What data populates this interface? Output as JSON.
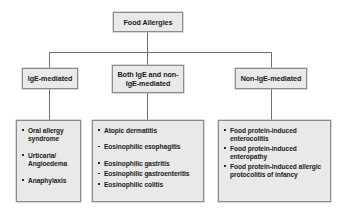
{
  "diagram": {
    "root": {
      "label": "Food Allergies"
    },
    "branches": [
      {
        "label": "IgE-mediated"
      },
      {
        "label": "Both IgE and non-IgE-mediated"
      },
      {
        "label": "Non-IgE-mediated"
      }
    ],
    "lists": [
      {
        "items": [
          "Oral allergy syndrome",
          "Urticaria/ Angioedema",
          "Anaphylaxis"
        ]
      },
      {
        "items": [
          "Atopic dermatitis",
          "Eosinophilic esophagitis",
          "Eosinophilic gastritis",
          "Eosinophilic gastroenteritis",
          "Eosinophilic colitis"
        ]
      },
      {
        "items": [
          "Food protein-induced enterocolitis",
          "Food protein-induced enteropathy",
          "Food protein-induced allergic protocolitis of infancy"
        ]
      }
    ],
    "colors": {
      "box_fill": "#e9e9e9",
      "box_border": "#8c8c8c",
      "connector": "#707070",
      "text": "#1a1a1a",
      "background": "#ffffff"
    }
  }
}
